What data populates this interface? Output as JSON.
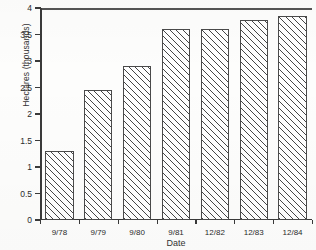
{
  "chart_data": {
    "type": "bar",
    "title": "",
    "xlabel": "Date",
    "ylabel": "Hectares (thousands)",
    "categories": [
      "9/78",
      "9/79",
      "9/80",
      "9/81",
      "12/82",
      "12/83",
      "12/84"
    ],
    "values": [
      1.3,
      2.45,
      2.9,
      3.6,
      3.6,
      3.78,
      3.85
    ],
    "ylim": [
      0,
      4
    ],
    "ytick_labels": [
      "0",
      "0.5",
      "1",
      "1.5",
      "2",
      "2.5",
      "3",
      "3.5",
      "4"
    ],
    "ytick_values": [
      0,
      0.5,
      1,
      1.5,
      2,
      2.5,
      3,
      3.5,
      4
    ],
    "grid": false,
    "legend": null,
    "bar_style": "diagonal-hatch-45",
    "bar_edge_color": "#4a4a4a",
    "bar_face_color": "#ffffff",
    "axis_color": "#3a3a3a"
  },
  "axes": {
    "y_title": "Hectares (thousands)",
    "x_title": "Date"
  }
}
